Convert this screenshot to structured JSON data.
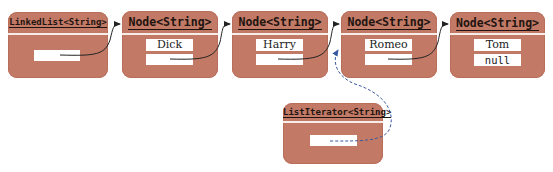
{
  "diagram": {
    "colors": {
      "box": "#c27a66",
      "header_text": "#1f1410",
      "field": "#ffffff",
      "link": "#222222",
      "iterator_link": "#3a5aa0"
    },
    "linked_list": {
      "header": "LinkedList<String>",
      "first_field": ""
    },
    "nodes": [
      {
        "header": "Node<String>",
        "data": "Dick",
        "next": ""
      },
      {
        "header": "Node<String>",
        "data": "Harry",
        "next": ""
      },
      {
        "header": "Node<String>",
        "data": "Romeo",
        "next": ""
      },
      {
        "header": "Node<String>",
        "data": "Tom",
        "next": "null"
      }
    ],
    "iterator": {
      "header": "ListIterator<String>",
      "position_field": ""
    }
  }
}
